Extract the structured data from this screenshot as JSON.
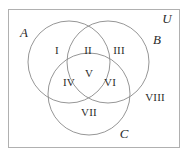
{
  "diagram": {
    "type": "venn-3-set",
    "title_visible": false,
    "colors": {
      "background": "#ffffff",
      "stroke": "#8a8a8a",
      "rect_stroke": "#b0b0b0",
      "text": "#2b2b2b"
    },
    "universe": {
      "label": "U",
      "rect": {
        "x": 8,
        "y": 9,
        "width": 171,
        "height": 138
      }
    },
    "sets": [
      {
        "id": "A",
        "label": "A",
        "cx": 69,
        "cy": 62,
        "r": 41,
        "label_x": 24,
        "label_y": 32
      },
      {
        "id": "B",
        "label": "B",
        "cx": 108,
        "cy": 62,
        "r": 41,
        "label_x": 157,
        "label_y": 39
      },
      {
        "id": "C",
        "label": "C",
        "cx": 89,
        "cy": 94,
        "r": 41,
        "label_x": 124,
        "label_y": 133
      }
    ],
    "regions": [
      {
        "id": "I",
        "label": "I",
        "x": 57,
        "y": 50,
        "meaning": "A only"
      },
      {
        "id": "II",
        "label": "II",
        "x": 88,
        "y": 50,
        "meaning": "A and B only"
      },
      {
        "id": "III",
        "label": "III",
        "x": 119,
        "y": 50,
        "meaning": "B only"
      },
      {
        "id": "IV",
        "label": "IV",
        "x": 69,
        "y": 82,
        "meaning": "A and C only"
      },
      {
        "id": "V",
        "label": "V",
        "x": 89,
        "y": 73,
        "meaning": "A and B and C"
      },
      {
        "id": "VI",
        "label": "VI",
        "x": 110,
        "y": 82,
        "meaning": "B and C only"
      },
      {
        "id": "VII",
        "label": "VII",
        "x": 89,
        "y": 112,
        "meaning": "C only"
      },
      {
        "id": "VIII",
        "label": "VIII",
        "x": 155,
        "y": 97,
        "meaning": "outside all sets"
      }
    ]
  }
}
